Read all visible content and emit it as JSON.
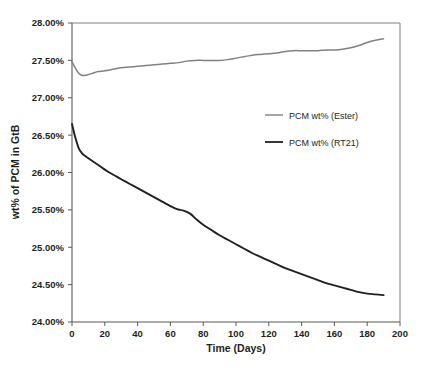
{
  "chart_data": {
    "type": "line",
    "title": "",
    "xlabel": "Time (Days)",
    "ylabel": "wt% of PCM in GtB",
    "xlim": [
      0,
      200
    ],
    "ylim": [
      24.0,
      28.0
    ],
    "xticks": [
      "0",
      "20",
      "40",
      "60",
      "80",
      "100",
      "120",
      "140",
      "160",
      "180",
      "200"
    ],
    "yticks": [
      "24.00%",
      "24.50%",
      "25.00%",
      "25.50%",
      "26.00%",
      "26.50%",
      "27.00%",
      "27.50%",
      "28.00%"
    ],
    "grid": false,
    "legend_position": "inside-right-upper",
    "series": [
      {
        "name": "PCM wt% (Ester)",
        "color": "#808080",
        "x": [
          0,
          2,
          4,
          6,
          8,
          10,
          13,
          16,
          20,
          25,
          30,
          35,
          40,
          45,
          50,
          55,
          60,
          65,
          70,
          75,
          80,
          85,
          90,
          95,
          100,
          105,
          110,
          115,
          120,
          125,
          130,
          135,
          140,
          145,
          150,
          155,
          160,
          165,
          170,
          175,
          180,
          185,
          190
        ],
        "y": [
          27.48,
          27.4,
          27.33,
          27.3,
          27.3,
          27.31,
          27.33,
          27.35,
          27.36,
          27.38,
          27.4,
          27.41,
          27.42,
          27.43,
          27.44,
          27.45,
          27.46,
          27.47,
          27.49,
          27.5,
          27.5,
          27.5,
          27.5,
          27.51,
          27.53,
          27.55,
          27.57,
          27.58,
          27.59,
          27.6,
          27.62,
          27.63,
          27.63,
          27.63,
          27.63,
          27.64,
          27.64,
          27.65,
          27.67,
          27.7,
          27.74,
          27.77,
          27.79
        ]
      },
      {
        "name": "PCM wt% (RT21)",
        "color": "#231f20",
        "x": [
          0,
          2,
          4,
          6,
          8,
          10,
          14,
          18,
          22,
          26,
          30,
          35,
          40,
          45,
          50,
          55,
          60,
          64,
          68,
          72,
          76,
          80,
          85,
          90,
          95,
          100,
          105,
          110,
          115,
          120,
          125,
          130,
          135,
          140,
          145,
          150,
          155,
          160,
          165,
          170,
          175,
          180,
          185,
          190
        ],
        "y": [
          26.65,
          26.47,
          26.33,
          26.26,
          26.22,
          26.19,
          26.13,
          26.07,
          26.01,
          25.96,
          25.91,
          25.85,
          25.79,
          25.73,
          25.67,
          25.61,
          25.55,
          25.51,
          25.49,
          25.45,
          25.37,
          25.3,
          25.23,
          25.16,
          25.1,
          25.04,
          24.98,
          24.92,
          24.87,
          24.82,
          24.77,
          24.72,
          24.68,
          24.64,
          24.6,
          24.56,
          24.52,
          24.49,
          24.46,
          24.43,
          24.4,
          24.38,
          24.37,
          24.36
        ]
      }
    ]
  },
  "legend": {
    "items": [
      {
        "label": "PCM wt% (Ester)",
        "color": "#808080",
        "swatch_name": "legend-swatch-ester"
      },
      {
        "label": "PCM wt% (RT21)",
        "color": "#231f20",
        "swatch_name": "legend-swatch-rt21"
      }
    ]
  },
  "axes": {
    "x_title": "Time (Days)",
    "y_title": "wt% of PCM in GtB"
  }
}
